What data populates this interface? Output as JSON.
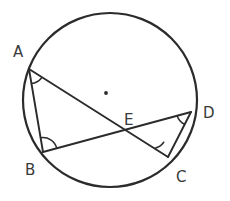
{
  "figure": {
    "type": "circle-geometry-diagram",
    "background_color": "#ffffff",
    "stroke_color": "#2b2b2b",
    "label_color": "#3a3a3a"
  },
  "circle": {
    "name": "circumscribing-circle",
    "center_x": 110,
    "center_y": 100,
    "radius": 87,
    "stroke_width": 2.2
  },
  "center_marker": {
    "name": "circle-center-dot",
    "x": 106,
    "y": 93,
    "radius": 1.9
  },
  "points": [
    {
      "id": "A",
      "label": "A",
      "x": 29,
      "y": 69,
      "label_x": 13,
      "label_y": 57
    },
    {
      "id": "B",
      "label": "B",
      "x": 43,
      "y": 152,
      "label_x": 25,
      "label_y": 175
    },
    {
      "id": "C",
      "label": "C",
      "x": 168,
      "y": 157,
      "label_x": 176,
      "label_y": 182
    },
    {
      "id": "D",
      "label": "D",
      "x": 191,
      "y": 112,
      "label_x": 203,
      "label_y": 118
    },
    {
      "id": "E",
      "label": "E",
      "x": 128,
      "y": 136,
      "label_x": 124,
      "label_y": 125
    }
  ],
  "segments": [
    {
      "name": "chord-AB",
      "from": "A",
      "to": "B",
      "x1": 29,
      "y1": 69,
      "x2": 43,
      "y2": 152
    },
    {
      "name": "chord-AC",
      "from": "A",
      "to": "C",
      "x1": 29,
      "y1": 69,
      "x2": 168,
      "y2": 157
    },
    {
      "name": "chord-BD",
      "from": "B",
      "to": "D",
      "x1": 43,
      "y1": 152,
      "x2": 191,
      "y2": 112
    },
    {
      "name": "chord-CD",
      "from": "C",
      "to": "D",
      "x1": 168,
      "y1": 157,
      "x2": 191,
      "y2": 112
    }
  ],
  "angle_markers": [
    {
      "name": "angle-marker-A",
      "at": "A",
      "description": "angle BAC marked at vertex A"
    },
    {
      "name": "angle-marker-B",
      "at": "B",
      "description": "angle ABD marked at vertex B"
    },
    {
      "name": "angle-marker-C",
      "at": "C",
      "description": "angle ACD marked at vertex C"
    },
    {
      "name": "angle-marker-D",
      "at": "D",
      "description": "angle BDC marked at vertex D"
    }
  ],
  "intersection": {
    "name": "chord-intersection-E",
    "label": "E",
    "x": 128,
    "y": 136
  }
}
